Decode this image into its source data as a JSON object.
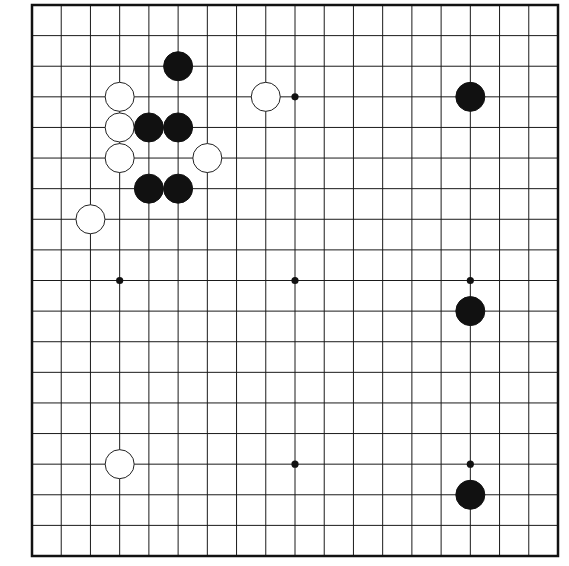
{
  "diagram": {
    "type": "go-board",
    "size": 19,
    "caption": "Go board position",
    "colors": {
      "background": "#ffffff",
      "line": "#1a1a1a",
      "border": "#111111",
      "black_stone": "#111111",
      "white_stone": "#ffffff",
      "white_stone_outline": "#222222",
      "hoshi": "#111111"
    },
    "geometry": {
      "left": 32,
      "top": 5,
      "right": 558,
      "bottom": 556,
      "stone_radius": 14.5,
      "hoshi_radius": 3.6,
      "line_width": 1,
      "border_width": 2.5
    },
    "hoshi": [
      {
        "col": 3,
        "row": 3
      },
      {
        "col": 9,
        "row": 3
      },
      {
        "col": 15,
        "row": 3
      },
      {
        "col": 3,
        "row": 9
      },
      {
        "col": 9,
        "row": 9
      },
      {
        "col": 15,
        "row": 9
      },
      {
        "col": 3,
        "row": 15
      },
      {
        "col": 9,
        "row": 15
      },
      {
        "col": 15,
        "row": 15
      }
    ],
    "stones": [
      {
        "color": "black",
        "col": 5,
        "row": 2
      },
      {
        "color": "white",
        "col": 3,
        "row": 3
      },
      {
        "color": "white",
        "col": 8,
        "row": 3
      },
      {
        "color": "black",
        "col": 15,
        "row": 3
      },
      {
        "color": "white",
        "col": 3,
        "row": 4
      },
      {
        "color": "black",
        "col": 4,
        "row": 4
      },
      {
        "color": "black",
        "col": 5,
        "row": 4
      },
      {
        "color": "white",
        "col": 3,
        "row": 5
      },
      {
        "color": "white",
        "col": 6,
        "row": 5
      },
      {
        "color": "black",
        "col": 4,
        "row": 6
      },
      {
        "color": "black",
        "col": 5,
        "row": 6
      },
      {
        "color": "white",
        "col": 2,
        "row": 7
      },
      {
        "color": "black",
        "col": 15,
        "row": 10
      },
      {
        "color": "white",
        "col": 3,
        "row": 15
      },
      {
        "color": "black",
        "col": 15,
        "row": 16
      }
    ],
    "counts": {
      "black": 8,
      "white": 7
    }
  }
}
